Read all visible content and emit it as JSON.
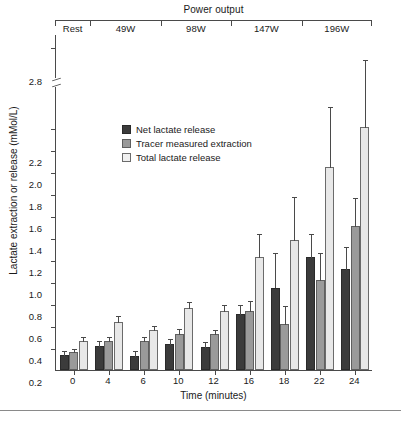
{
  "chart_data": {
    "type": "bar",
    "title": "",
    "xlabel": "Time (minutes)",
    "ylabel": "Lactate extraction or release (mMol/L)",
    "categories": [
      "0",
      "4",
      "6",
      "10",
      "12",
      "16",
      "18",
      "22",
      "24"
    ],
    "ylim": [
      0,
      2.3
    ],
    "yticks": [
      0.2,
      0.4,
      0.6,
      0.8,
      1.0,
      1.2,
      1.4,
      1.6,
      1.8,
      2.0,
      2.2,
      2.8
    ],
    "ytick_labels": [
      "0.2",
      "0.4",
      "0.6",
      "0.8",
      "1.0",
      "1.2",
      "1.4",
      "1.6",
      "1.8",
      "2.0",
      "2.2",
      "2.8"
    ],
    "axis_break": {
      "present": true,
      "below": 2.2,
      "above": 2.8
    },
    "grid": false,
    "legend_position": "upper-left",
    "series": [
      {
        "name": "Net lactate release",
        "color": "#3b3b3b",
        "values": [
          0.14,
          0.22,
          0.13,
          0.24,
          0.21,
          0.51,
          0.75,
          1.03,
          0.92
        ],
        "errors": [
          0.04,
          0.05,
          0.05,
          0.05,
          0.05,
          0.09,
          0.32,
          0.22,
          0.21
        ]
      },
      {
        "name": "Tracer measured extraction",
        "color": "#9a9a9a",
        "values": [
          0.16,
          0.26,
          0.26,
          0.33,
          0.33,
          0.54,
          0.42,
          0.82,
          1.31
        ],
        "errors": [
          0.04,
          0.05,
          0.05,
          0.05,
          0.04,
          0.1,
          0.17,
          0.25,
          0.26
        ]
      },
      {
        "name": "Total lactate release",
        "color": "#e8e8e8",
        "values": [
          0.26,
          0.44,
          0.36,
          0.56,
          0.54,
          1.03,
          1.18,
          1.85,
          2.21
        ],
        "errors": [
          0.05,
          0.06,
          0.05,
          0.07,
          0.06,
          0.22,
          0.4,
          0.55,
          0.62
        ]
      }
    ]
  },
  "header": {
    "power_output_title": "Power output",
    "stages": [
      {
        "label": "Rest",
        "start": 0,
        "end": 1
      },
      {
        "label": "49W",
        "start": 1,
        "end": 3
      },
      {
        "label": "98W",
        "start": 3,
        "end": 5
      },
      {
        "label": "147W",
        "start": 5,
        "end": 7
      },
      {
        "label": "196W",
        "start": 7,
        "end": 9
      }
    ]
  },
  "legend": {
    "items": [
      {
        "label": "Net lactate release"
      },
      {
        "label": "Tracer measured extraction"
      },
      {
        "label": "Total lactate release"
      }
    ]
  }
}
